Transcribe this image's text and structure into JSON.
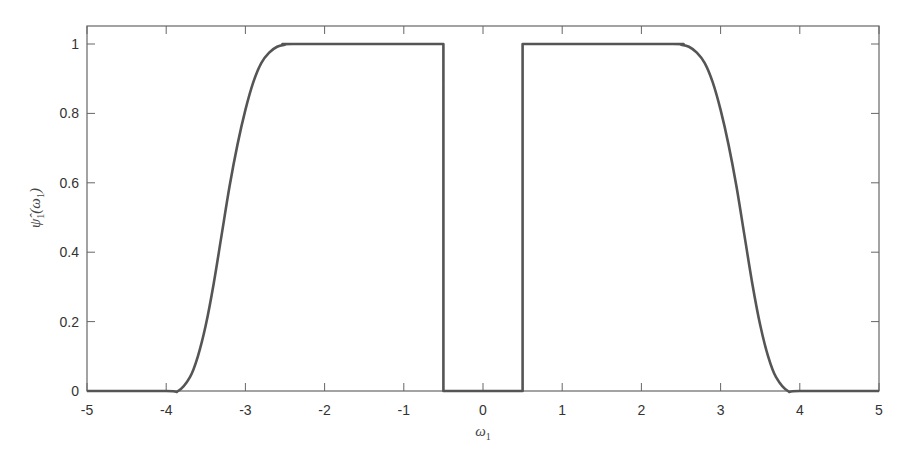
{
  "chart_data": {
    "type": "line",
    "title": "",
    "xlabel": "ω1",
    "ylabel": "ψ̂1(ω1)",
    "xlim": [
      -5,
      5
    ],
    "ylim": [
      0,
      1.05
    ],
    "xticks": [
      -5,
      -4,
      -3,
      -2,
      -1,
      0,
      1,
      2,
      3,
      4,
      5
    ],
    "xtick_labels": [
      "-5",
      "-4",
      "-3",
      "-2",
      "-1",
      "0",
      "1",
      "2",
      "3",
      "4",
      "5"
    ],
    "yticks": [
      0,
      0.2,
      0.4,
      0.6,
      0.8,
      1
    ],
    "ytick_labels": [
      "0",
      "0.2",
      "0.4",
      "0.6",
      "0.8",
      "1"
    ],
    "grid": false,
    "legend": null,
    "series": [
      {
        "name": "psi_hat_1",
        "color": "#555555",
        "x": [
          -5,
          -4,
          -3.85,
          -3.7,
          -3.6,
          -3.5,
          -3.4,
          -3.3,
          -3.2,
          -3.1,
          -3.0,
          -2.9,
          -2.8,
          -2.7,
          -2.6,
          -2.5,
          -2.4,
          -1.0,
          -0.5,
          -0.5,
          0,
          0.5,
          0.5,
          1.0,
          2.4,
          2.5,
          2.6,
          2.7,
          2.8,
          2.9,
          3.0,
          3.1,
          3.2,
          3.3,
          3.4,
          3.5,
          3.6,
          3.7,
          3.85,
          4,
          5
        ],
        "y": [
          0,
          0,
          0,
          0.04,
          0.1,
          0.19,
          0.31,
          0.45,
          0.59,
          0.71,
          0.81,
          0.89,
          0.945,
          0.975,
          0.992,
          0.998,
          1,
          1,
          1,
          0,
          0,
          0,
          1,
          1,
          1,
          0.998,
          0.992,
          0.975,
          0.945,
          0.89,
          0.81,
          0.71,
          0.59,
          0.45,
          0.31,
          0.19,
          0.1,
          0.04,
          0,
          0,
          0
        ]
      }
    ]
  },
  "axes": {
    "color": "#555555",
    "frame_color": "#666666"
  }
}
